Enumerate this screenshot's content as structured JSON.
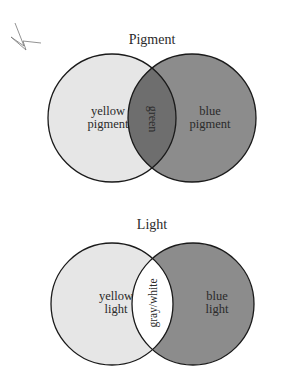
{
  "diagrams": [
    {
      "title": "Pigment",
      "left": {
        "line1": "yellow",
        "line2": "pigment",
        "fill": "#e6e6e6"
      },
      "right": {
        "line1": "blue",
        "line2": "pigment",
        "fill": "#8c8c8c"
      },
      "overlap": {
        "label": "green",
        "fill": "#6e6e6e"
      }
    },
    {
      "title": "Light",
      "left": {
        "line1": "yellow",
        "line2": "light",
        "fill": "#e6e6e6"
      },
      "right": {
        "line1": "blue",
        "line2": "light",
        "fill": "#8c8c8c"
      },
      "overlap": {
        "label": "gray/white",
        "fill": "#ffffff"
      }
    }
  ],
  "colors": {
    "stroke": "#1a1a1a",
    "background": "#ffffff"
  }
}
